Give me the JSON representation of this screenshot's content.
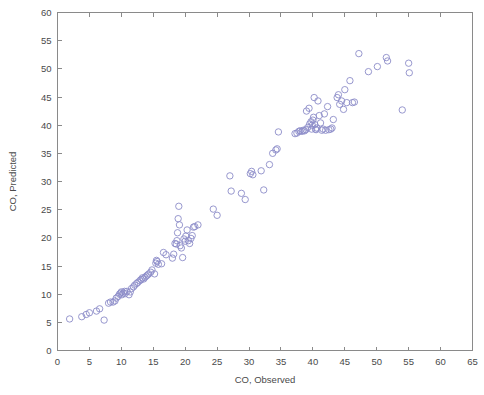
{
  "figure": {
    "type": "scatter-plot",
    "background_color": "#ffffff",
    "axis_color": "#8a8a8a",
    "marker_color": "#8c8cc8"
  },
  "chart_data": {
    "type": "scatter",
    "title": "",
    "subtitle": "",
    "xlabel": "CO, Observed",
    "ylabel": "CO, Predicted",
    "xlim": [
      0,
      65
    ],
    "ylim": [
      0,
      60
    ],
    "xticks": [
      0,
      5,
      10,
      15,
      20,
      25,
      30,
      35,
      40,
      45,
      50,
      55,
      60,
      65
    ],
    "yticks": [
      0,
      5,
      10,
      15,
      20,
      25,
      30,
      35,
      40,
      45,
      50,
      55,
      60
    ],
    "xtick_labels": [
      "0",
      "5",
      "10",
      "15",
      "20",
      "25",
      "30",
      "35",
      "40",
      "45",
      "50",
      "55",
      "60",
      "65"
    ],
    "ytick_labels": [
      "0",
      "5",
      "10",
      "15",
      "20",
      "25",
      "30",
      "35",
      "40",
      "45",
      "50",
      "55",
      "60"
    ],
    "grid": false,
    "legend": null,
    "legend_position": "none",
    "marker": "open-circle",
    "marker_size": 3.2,
    "series": [
      {
        "name": "CO predicted vs observed",
        "color": "#8c8cc8",
        "points": [
          [
            1.9,
            5.6
          ],
          [
            3.8,
            6.0
          ],
          [
            4.5,
            6.4
          ],
          [
            5.0,
            6.7
          ],
          [
            6.1,
            7.0
          ],
          [
            6.6,
            7.4
          ],
          [
            7.3,
            5.4
          ],
          [
            8.0,
            8.4
          ],
          [
            8.3,
            8.6
          ],
          [
            8.7,
            8.6
          ],
          [
            9.0,
            8.8
          ],
          [
            9.2,
            9.3
          ],
          [
            9.5,
            9.6
          ],
          [
            9.7,
            10.0
          ],
          [
            9.9,
            10.2
          ],
          [
            10.0,
            10.4
          ],
          [
            10.1,
            9.9
          ],
          [
            10.3,
            10.2
          ],
          [
            10.5,
            10.5
          ],
          [
            10.6,
            10.1
          ],
          [
            10.9,
            10.5
          ],
          [
            11.2,
            9.9
          ],
          [
            11.4,
            10.4
          ],
          [
            11.6,
            11.0
          ],
          [
            11.9,
            11.3
          ],
          [
            12.1,
            11.6
          ],
          [
            12.4,
            11.9
          ],
          [
            12.6,
            12.1
          ],
          [
            12.9,
            12.4
          ],
          [
            13.1,
            12.6
          ],
          [
            13.3,
            12.9
          ],
          [
            13.5,
            12.7
          ],
          [
            13.7,
            13.0
          ],
          [
            13.9,
            13.2
          ],
          [
            14.1,
            13.4
          ],
          [
            14.3,
            13.6
          ],
          [
            14.6,
            13.9
          ],
          [
            14.8,
            14.3
          ],
          [
            15.2,
            13.6
          ],
          [
            15.4,
            15.5
          ],
          [
            15.5,
            16.0
          ],
          [
            15.6,
            15.8
          ],
          [
            15.8,
            15.3
          ],
          [
            16.3,
            15.4
          ],
          [
            16.6,
            17.4
          ],
          [
            17.0,
            17.0
          ],
          [
            18.0,
            16.4
          ],
          [
            18.2,
            17.1
          ],
          [
            18.4,
            19.0
          ],
          [
            18.6,
            18.9
          ],
          [
            18.7,
            19.5
          ],
          [
            18.8,
            20.9
          ],
          [
            18.9,
            23.4
          ],
          [
            19.0,
            25.6
          ],
          [
            19.1,
            22.3
          ],
          [
            19.2,
            18.6
          ],
          [
            19.4,
            18.2
          ],
          [
            19.6,
            16.5
          ],
          [
            19.8,
            19.8
          ],
          [
            20.0,
            19.4
          ],
          [
            20.1,
            20.3
          ],
          [
            20.3,
            21.4
          ],
          [
            20.5,
            19.5
          ],
          [
            20.7,
            19.0
          ],
          [
            20.9,
            19.9
          ],
          [
            21.1,
            20.4
          ],
          [
            21.3,
            21.9
          ],
          [
            21.5,
            22.0
          ],
          [
            22.0,
            22.3
          ],
          [
            24.4,
            25.1
          ],
          [
            25.0,
            24.0
          ],
          [
            27.0,
            31.0
          ],
          [
            27.2,
            28.3
          ],
          [
            28.8,
            27.9
          ],
          [
            29.4,
            26.8
          ],
          [
            30.2,
            31.4
          ],
          [
            30.4,
            31.8
          ],
          [
            30.6,
            31.2
          ],
          [
            31.9,
            31.9
          ],
          [
            32.3,
            28.5
          ],
          [
            33.2,
            33.0
          ],
          [
            33.7,
            35.0
          ],
          [
            34.2,
            35.6
          ],
          [
            34.4,
            35.8
          ],
          [
            34.6,
            38.8
          ],
          [
            37.2,
            38.5
          ],
          [
            37.5,
            38.6
          ],
          [
            37.8,
            38.9
          ],
          [
            38.0,
            39.0
          ],
          [
            38.3,
            38.9
          ],
          [
            38.5,
            39.1
          ],
          [
            38.7,
            39.0
          ],
          [
            38.9,
            39.2
          ],
          [
            39.0,
            42.5
          ],
          [
            39.2,
            39.6
          ],
          [
            39.4,
            43.0
          ],
          [
            39.5,
            40.2
          ],
          [
            39.7,
            40.6
          ],
          [
            39.8,
            39.3
          ],
          [
            39.9,
            40.0
          ],
          [
            40.0,
            40.9
          ],
          [
            40.1,
            41.4
          ],
          [
            40.2,
            44.9
          ],
          [
            40.3,
            40.1
          ],
          [
            40.4,
            39.3
          ],
          [
            40.5,
            39.2
          ],
          [
            40.6,
            39.5
          ],
          [
            40.8,
            44.3
          ],
          [
            41.0,
            41.7
          ],
          [
            41.2,
            40.4
          ],
          [
            41.4,
            39.1
          ],
          [
            41.6,
            39.3
          ],
          [
            41.8,
            42.0
          ],
          [
            42.0,
            39.1
          ],
          [
            42.3,
            43.3
          ],
          [
            42.5,
            39.2
          ],
          [
            42.8,
            39.3
          ],
          [
            43.0,
            39.5
          ],
          [
            43.2,
            41.0
          ],
          [
            43.8,
            44.9
          ],
          [
            44.0,
            45.4
          ],
          [
            44.2,
            43.7
          ],
          [
            44.5,
            44.3
          ],
          [
            44.8,
            42.8
          ],
          [
            45.0,
            46.3
          ],
          [
            45.3,
            44.0
          ],
          [
            45.8,
            47.9
          ],
          [
            46.2,
            44.0
          ],
          [
            46.5,
            44.1
          ],
          [
            47.2,
            52.7
          ],
          [
            48.7,
            49.5
          ],
          [
            50.1,
            50.4
          ],
          [
            51.5,
            52.0
          ],
          [
            51.7,
            51.4
          ],
          [
            54.0,
            42.7
          ],
          [
            55.0,
            51.0
          ],
          [
            55.1,
            49.3
          ]
        ]
      }
    ]
  }
}
